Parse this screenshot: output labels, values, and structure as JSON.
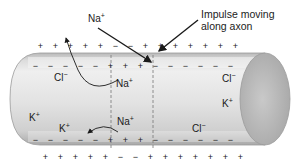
{
  "diagram": {
    "type": "nerve impulse along axon",
    "callout": {
      "line1": "Impulse moving",
      "line2": "along axon"
    },
    "ions": {
      "na_top": {
        "symbol": "Na",
        "charge": "+"
      },
      "na_inside_upper": {
        "symbol": "Na",
        "charge": "+"
      },
      "na_inside_lower": {
        "symbol": "Na",
        "charge": "+"
      },
      "cl_left": {
        "symbol": "Cl",
        "charge": "−"
      },
      "cl_right_upper": {
        "symbol": "Cl",
        "charge": "−"
      },
      "cl_right_lower": {
        "symbol": "Cl",
        "charge": "−"
      },
      "k_left": {
        "symbol": "K",
        "charge": "+"
      },
      "k_left_lower": {
        "symbol": "K",
        "charge": "+"
      },
      "k_right": {
        "symbol": "K",
        "charge": "+"
      }
    },
    "charges": {
      "outer_top": [
        "+",
        "+",
        "+",
        "+",
        "+",
        "−",
        "−",
        "+",
        "+",
        "+",
        "+",
        "+",
        "+",
        "+",
        "+"
      ],
      "inner_top": [
        "−",
        "−",
        "−",
        "−",
        "−",
        "+",
        "+",
        "+",
        "−",
        "−",
        "−",
        "−",
        "−",
        "−"
      ],
      "inner_bottom": [
        "−",
        "−",
        "−",
        "−",
        "−",
        "+",
        "+",
        "+",
        "−",
        "−",
        "−",
        "−",
        "−",
        "−"
      ],
      "outer_bottom": [
        "+",
        "+",
        "+",
        "+",
        "+",
        "−",
        "−",
        "+",
        "+",
        "+",
        "+",
        "+",
        "+",
        "+"
      ]
    },
    "colors": {
      "axon_light": "#ececec",
      "axon_mid": "#d2d2d2",
      "axon_dark": "#b4b4b4",
      "end_cap": "#bdbdbd",
      "arrow": "#1a1a1a",
      "dashed_line": "#777777"
    }
  }
}
